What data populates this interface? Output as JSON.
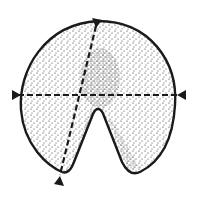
{
  "diagram": {
    "colors": {
      "outline": "#1a1a1a",
      "stipple": "#2a2a2a",
      "background": "#ffffff"
    },
    "shape": {
      "type": "notched-disc",
      "center": [
        98,
        97
      ],
      "radius": 76,
      "notch_apex": [
        99,
        106
      ],
      "left_lobe_bottom": [
        62,
        172
      ],
      "right_lobe_bottom": [
        138,
        172
      ]
    },
    "axes": [
      {
        "name": "horizontal-axis",
        "from": [
          13,
          95
        ],
        "to": [
          184,
          95
        ],
        "style": "dashed",
        "arrowheads": "both-ends-pointing-inward"
      },
      {
        "name": "oblique-axis",
        "from": [
          97,
          20
        ],
        "to": [
          58,
          180
        ],
        "style": "dashed",
        "arrowheads": "both-ends-pointing-inward"
      }
    ]
  }
}
